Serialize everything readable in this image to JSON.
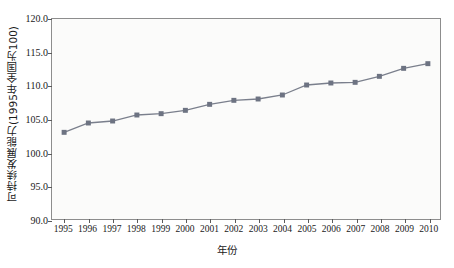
{
  "chart_data": {
    "type": "line",
    "title": "",
    "xlabel": "年份",
    "ylabel": "可持续发展能力(1995年全国为100)",
    "categories": [
      "1995",
      "1996",
      "1997",
      "1998",
      "1999",
      "2000",
      "2001",
      "2002",
      "2003",
      "2004",
      "2005",
      "2006",
      "2007",
      "2008",
      "2009",
      "2010"
    ],
    "x": [
      1995,
      1996,
      1997,
      1998,
      1999,
      2000,
      2001,
      2002,
      2003,
      2004,
      2005,
      2006,
      2007,
      2008,
      2009,
      2010
    ],
    "values": [
      103.0,
      104.4,
      104.7,
      105.6,
      105.8,
      106.3,
      107.2,
      107.8,
      108.0,
      108.6,
      110.1,
      110.4,
      110.5,
      111.4,
      112.6,
      113.3
    ],
    "series": [
      {
        "name": "可持续发展能力",
        "values": [
          103.0,
          104.4,
          104.7,
          105.6,
          105.8,
          106.3,
          107.2,
          107.8,
          108.0,
          108.6,
          110.1,
          110.4,
          110.5,
          111.4,
          112.6,
          113.3
        ]
      }
    ],
    "ylim": [
      90.0,
      120.0
    ],
    "xlim": [
      1994.5,
      2010.5
    ],
    "yticks": [
      90.0,
      95.0,
      100.0,
      105.0,
      110.0,
      115.0,
      120.0
    ],
    "ytick_labels": [
      "90.0",
      "95.0",
      "100.0",
      "105.0",
      "110.0",
      "115.0",
      "120.0"
    ],
    "grid": false,
    "legend": "none",
    "marker": "square",
    "line_color": "#7a7f8c",
    "marker_color": "#6d7382",
    "plot_background": "#fbfbfa",
    "axis_color": "#8d8d8d"
  }
}
